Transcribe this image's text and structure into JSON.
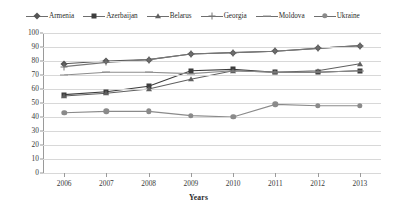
{
  "chart_data": {
    "type": "line",
    "title": "",
    "xlabel": "Years",
    "ylabel": "",
    "categories": [
      "2006",
      "2007",
      "2008",
      "2009",
      "2010",
      "2011",
      "2012",
      "2013"
    ],
    "x": [
      2006,
      2007,
      2008,
      2009,
      2010,
      2011,
      2012,
      2013
    ],
    "ylim": [
      0,
      100
    ],
    "yticks": [
      0,
      10,
      20,
      30,
      40,
      50,
      60,
      70,
      80,
      90,
      100
    ],
    "grid": true,
    "legend_position": "top",
    "series": [
      {
        "name": "Armenia",
        "marker": "diamond",
        "color": "#555555",
        "values": [
          78,
          80,
          81,
          85,
          86,
          87,
          89,
          91
        ]
      },
      {
        "name": "Azerbaijan",
        "marker": "square",
        "color": "#3d3d3d",
        "values": [
          56,
          58,
          62,
          73,
          74,
          72,
          72,
          73
        ]
      },
      {
        "name": "Belarus",
        "marker": "triangle",
        "color": "#606060",
        "values": [
          55,
          57,
          60,
          67,
          73,
          72,
          73,
          78
        ]
      },
      {
        "name": "Georgia",
        "marker": "cross",
        "color": "#777777",
        "values": [
          76,
          79,
          81,
          85,
          86,
          87,
          89,
          91
        ]
      },
      {
        "name": "Moldova",
        "marker": "dash",
        "color": "#8d8d8d",
        "values": [
          70,
          72,
          72,
          71,
          73,
          72,
          72,
          73
        ]
      },
      {
        "name": "Ukraine",
        "marker": "circle",
        "color": "#8a8a8a",
        "values": [
          43,
          44,
          44,
          41,
          40,
          49,
          48,
          48
        ]
      }
    ]
  },
  "legend": {
    "items": [
      {
        "label": "Armenia",
        "marker": "diamond"
      },
      {
        "label": "Azerbaijan",
        "marker": "square"
      },
      {
        "label": "Belarus",
        "marker": "triangle"
      },
      {
        "label": "Georgia",
        "marker": "cross"
      },
      {
        "label": "Moldova",
        "marker": "dash"
      },
      {
        "label": "Ukraine",
        "marker": "circle"
      }
    ]
  },
  "axes": {
    "x_title": "Years"
  }
}
